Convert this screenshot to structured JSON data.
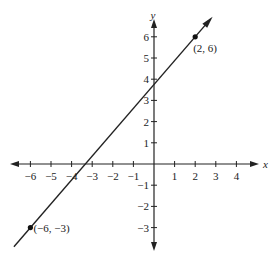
{
  "chart_data": {
    "type": "line",
    "title": "",
    "xlabel": "x",
    "ylabel": "y",
    "xlim": [
      -6.3,
      4.5
    ],
    "ylim": [
      -3.9,
      6.6
    ],
    "x_ticks": [
      -6,
      -5,
      -4,
      -3,
      -2,
      -1,
      1,
      2,
      3,
      4
    ],
    "y_ticks": [
      -3,
      -2,
      -1,
      1,
      2,
      3,
      4,
      5,
      6
    ],
    "x_tick_labels": [
      "−6",
      "−5",
      "−4",
      "−3",
      "−2",
      "−1",
      "1",
      "2",
      "3",
      "4"
    ],
    "y_tick_labels": [
      "−3",
      "−2",
      "−1",
      "1",
      "2",
      "3",
      "4",
      "5",
      "6"
    ],
    "grid": false,
    "series": [
      {
        "name": "line",
        "x": [
          -6,
          2
        ],
        "y": [
          -3,
          6
        ],
        "slope": 1.125,
        "intercept": 3.75
      }
    ],
    "points": [
      {
        "x": 2,
        "y": 6,
        "label": "(2, 6)"
      },
      {
        "x": -6,
        "y": -3,
        "label": "(−6, −3)"
      }
    ]
  }
}
